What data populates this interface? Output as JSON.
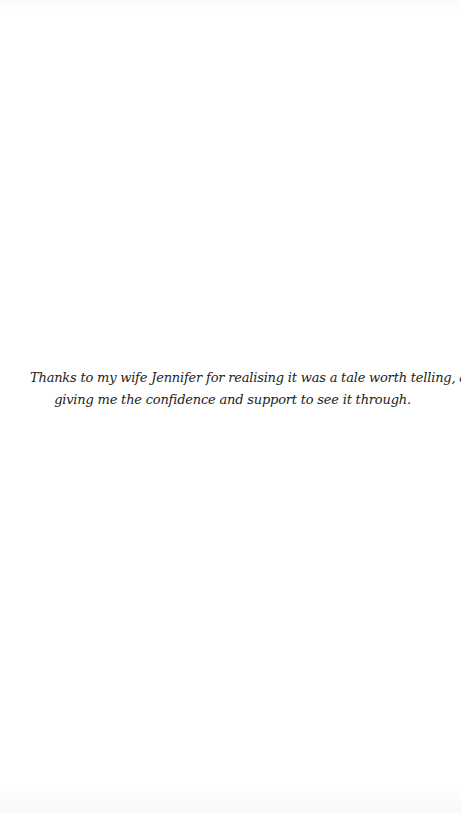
{
  "page": {
    "background": "#ffffff",
    "text_color": "#222222"
  },
  "dedication": {
    "lines": [
      "Thanks to my wife Jennifer for realising it was a tale worth telling, and",
      "giving me the confidence and support to see it through."
    ]
  }
}
